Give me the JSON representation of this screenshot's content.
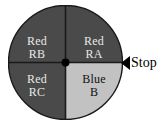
{
  "figure": {
    "type": "spinner-wheel-diagram",
    "background_color": "#ffffff"
  },
  "wheel": {
    "center": {
      "x": 65,
      "y": 62
    },
    "radius": 57,
    "outline_color": "#1a1a1a",
    "hub_color": "#000000",
    "divider_color": "#1a1a1a",
    "sectors": [
      {
        "id": "RB",
        "position": "upper-left",
        "color_word": "Red",
        "code": "RB",
        "fill": "#4a4a4a",
        "text_color": "#e8e8e8",
        "start_angle": 180,
        "end_angle": 270
      },
      {
        "id": "RA",
        "position": "upper-right",
        "color_word": "Red",
        "code": "RA",
        "fill": "#4a4a4a",
        "text_color": "#e8e8e8",
        "start_angle": 270,
        "end_angle": 360
      },
      {
        "id": "RC",
        "position": "lower-left",
        "color_word": "Red",
        "code": "RC",
        "fill": "#4a4a4a",
        "text_color": "#e8e8e8",
        "start_angle": 90,
        "end_angle": 180
      },
      {
        "id": "B",
        "position": "lower-right",
        "color_word": "Blue",
        "code": "B",
        "fill": "#c2c2c2",
        "text_color": "#111111",
        "start_angle": 0,
        "end_angle": 90
      }
    ]
  },
  "marker": {
    "label": "Stop",
    "icon": "left-triangle-pointer",
    "color": "#000000"
  }
}
